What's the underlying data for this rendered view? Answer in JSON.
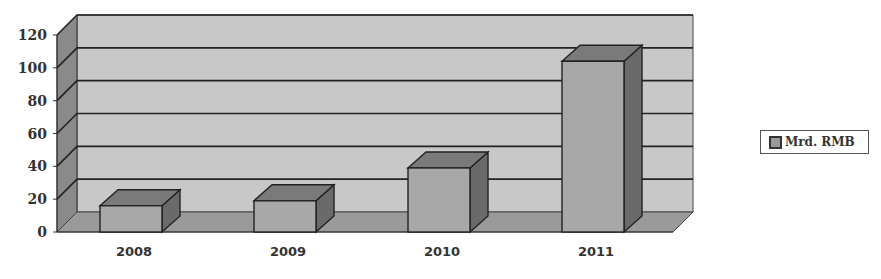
{
  "chart_data": {
    "type": "bar",
    "style": "3d-column",
    "title": "",
    "xlabel": "",
    "ylabel": "",
    "categories": [
      "2008",
      "2009",
      "2010",
      "2011"
    ],
    "series": [
      {
        "name": "Mrd. RMB",
        "values": [
          16,
          19,
          39,
          104
        ]
      }
    ],
    "ylim": [
      0,
      120
    ],
    "yticks": [
      0,
      20,
      40,
      60,
      80,
      100,
      120
    ],
    "grid": true,
    "legend_position": "right",
    "colors": {
      "bar": "#a8a8a8",
      "bar_top": "#7a7a7a",
      "bar_side": "#6a6a6a",
      "wall": "#c8c8c8",
      "side_wall": "#8a8a8a",
      "floor": "#9a9a9a"
    }
  },
  "legend": {
    "label": "Mrd. RMB"
  }
}
